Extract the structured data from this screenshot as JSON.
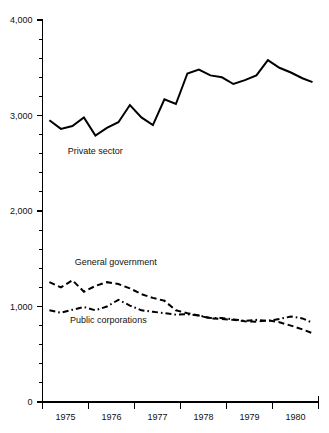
{
  "chart_data": {
    "type": "line",
    "title": "",
    "subtitle": "",
    "xlabel": "",
    "ylabel": "",
    "xlim": [
      1974.75,
      1980.75
    ],
    "ylim": [
      0,
      4000
    ],
    "grid": false,
    "legend_position": "inline-annotations",
    "y_ticks_major": [
      0,
      1000,
      2000,
      3000,
      4000
    ],
    "y_tick_labels": [
      "0",
      "1,000",
      "2,000",
      "3,000",
      "4,000"
    ],
    "y_tick_minor_step": 200,
    "x_tick_labels": [
      "1975",
      "1976",
      "1977",
      "1978",
      "1979",
      "1980"
    ],
    "x_band_boundaries": [
      1974.75,
      1975.75,
      1976.75,
      1977.75,
      1978.75,
      1979.75,
      1980.75
    ],
    "annotations": [
      {
        "text": "Private sector",
        "x": 1975.3,
        "y": 2600
      },
      {
        "text": "General government",
        "x": 1975.45,
        "y": 1430
      },
      {
        "text": "Public corporations",
        "x": 1975.35,
        "y": 830
      }
    ],
    "x": [
      1974.9,
      1975.15,
      1975.4,
      1975.65,
      1975.9,
      1976.15,
      1976.4,
      1976.65,
      1976.9,
      1977.15,
      1977.4,
      1977.65,
      1977.9,
      1978.15,
      1978.4,
      1978.65,
      1978.9,
      1979.15,
      1979.4,
      1979.65,
      1979.9,
      1980.15,
      1980.4,
      1980.62
    ],
    "series": [
      {
        "name": "Private sector",
        "style": "solid",
        "values": [
          2950,
          2860,
          2890,
          2980,
          2790,
          2870,
          2930,
          3110,
          2980,
          2900,
          3170,
          3120,
          3440,
          3480,
          3420,
          3400,
          3330,
          3370,
          3420,
          3580,
          3500,
          3450,
          3390,
          3350
        ]
      },
      {
        "name": "General government",
        "style": "dashed",
        "values": [
          1255,
          1200,
          1275,
          1155,
          1215,
          1255,
          1235,
          1190,
          1130,
          1090,
          1060,
          960,
          930,
          905,
          875,
          870,
          860,
          845,
          840,
          855,
          835,
          800,
          760,
          720
        ]
      },
      {
        "name": "Public corporations",
        "style": "dashdot",
        "values": [
          960,
          935,
          965,
          995,
          960,
          1000,
          1070,
          1010,
          960,
          945,
          930,
          915,
          920,
          905,
          880,
          880,
          865,
          850,
          860,
          850,
          870,
          895,
          875,
          830
        ]
      }
    ]
  }
}
